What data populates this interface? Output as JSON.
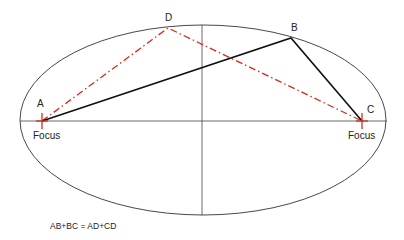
{
  "diagram": {
    "colors": {
      "ellipse": "#333333",
      "axes": "#444444",
      "solid_path": "#111111",
      "dashed_path": "#d42a1e",
      "focus_marker": "#d42a1e",
      "text": "#222222"
    },
    "ellipse": {
      "cx": 203,
      "cy": 120,
      "rx": 183,
      "ry": 95
    },
    "axes": {
      "major": {
        "x1": 20,
        "y1": 121,
        "x2": 387,
        "y2": 121
      },
      "minor": {
        "x1": 202,
        "y1": 25,
        "x2": 202,
        "y2": 215
      }
    },
    "points": {
      "A": {
        "label": "A",
        "x": 42,
        "y": 121,
        "label_x": 37,
        "label_y": 107
      },
      "B": {
        "label": "B",
        "x": 291,
        "y": 38,
        "label_x": 291,
        "label_y": 31
      },
      "C": {
        "label": "C",
        "x": 362,
        "y": 121,
        "label_x": 367,
        "label_y": 113
      },
      "D": {
        "label": "D",
        "x": 168,
        "y": 28,
        "label_x": 165,
        "label_y": 21
      }
    },
    "focus_labels": [
      {
        "text": "Focus",
        "x": 33,
        "y": 139
      },
      {
        "text": "Focus",
        "x": 348,
        "y": 139
      }
    ],
    "paths": [
      {
        "name": "A-B-C",
        "style": "solid",
        "points": [
          "A",
          "B",
          "C"
        ]
      },
      {
        "name": "A-D-C",
        "style": "dash-dot",
        "points": [
          "A",
          "D",
          "C"
        ]
      }
    ],
    "equation": {
      "text": "AB+BC = AD+CD",
      "x": 50,
      "y": 229
    }
  }
}
